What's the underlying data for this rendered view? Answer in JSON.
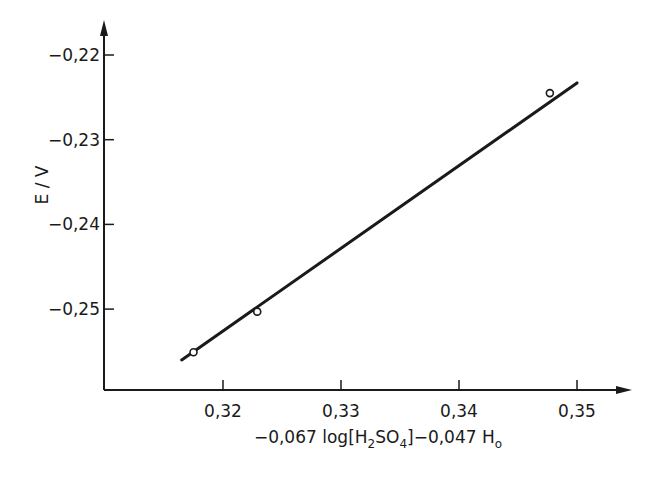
{
  "chart_data": {
    "type": "scatter",
    "title": "",
    "xlabel": "-0,067 log[H2SO4]-0,047 Ho",
    "xlabel_parts": {
      "prefix": "−0,067 log[H",
      "sub1": "2",
      "mid": "SO",
      "sub2": "4",
      "suffix": "]−0,047 H",
      "sub3": "o"
    },
    "ylabel": "E / V",
    "xlim": [
      0.3107,
      0.3546
    ],
    "ylim": [
      -0.2595,
      -0.2135
    ],
    "x_ticks": [
      0.32,
      0.33,
      0.34,
      0.35
    ],
    "x_tick_labels": [
      "0,32",
      "0,33",
      "0,34",
      "0,35"
    ],
    "y_ticks": [
      -0.22,
      -0.23,
      -0.24,
      -0.25
    ],
    "y_tick_labels": [
      "−0,22",
      "−0,23",
      "−0,24",
      "−0,25"
    ],
    "grid": false,
    "legend": null,
    "series": [
      {
        "name": "measured",
        "marker": "open-circle",
        "x": [
          0.3175,
          0.3229,
          0.3477
        ],
        "y": [
          -0.2551,
          -0.2503,
          -0.2245
        ]
      },
      {
        "name": "linear fit",
        "type": "line",
        "x": [
          0.3165,
          0.35
        ],
        "y": [
          -0.256,
          -0.2233
        ]
      }
    ]
  },
  "colors": {
    "ink": "#1a1a1a",
    "background": "#ffffff"
  }
}
